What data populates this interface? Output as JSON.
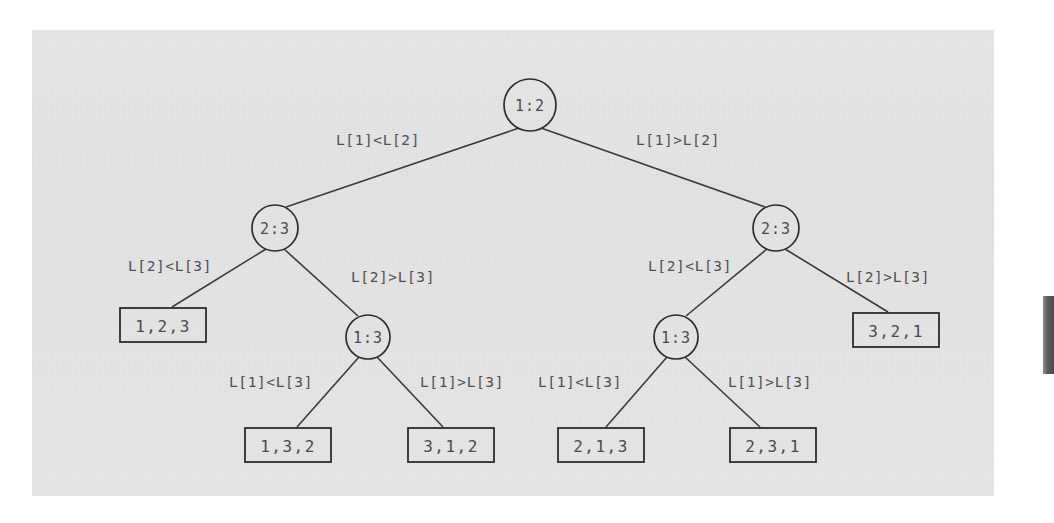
{
  "figure": {
    "type": "decision-tree",
    "background_color": "#e3e3e3",
    "ink_color": "#3a3a3a"
  },
  "nodes": [
    {
      "id": "root",
      "label": "1:2",
      "cx": 530,
      "cy": 105,
      "r": 26
    },
    {
      "id": "n-l",
      "label": "2:3",
      "cx": 275,
      "cy": 228,
      "r": 23
    },
    {
      "id": "n-r",
      "label": "2:3",
      "cx": 776,
      "cy": 228,
      "r": 23
    },
    {
      "id": "n-l-13",
      "label": "1:3",
      "cx": 368,
      "cy": 337,
      "r": 22
    },
    {
      "id": "n-r-13",
      "label": "1:3",
      "cx": 676,
      "cy": 337,
      "r": 22
    }
  ],
  "leaves": [
    {
      "id": "leaf-123",
      "label": "1,2,3",
      "x": 120,
      "y": 308,
      "w": 86,
      "h": 34
    },
    {
      "id": "leaf-132",
      "label": "1,3,2",
      "x": 245,
      "y": 428,
      "w": 86,
      "h": 34
    },
    {
      "id": "leaf-312",
      "label": "3,1,2",
      "x": 408,
      "y": 428,
      "w": 86,
      "h": 34
    },
    {
      "id": "leaf-213",
      "label": "2,1,3",
      "x": 558,
      "y": 428,
      "w": 86,
      "h": 34
    },
    {
      "id": "leaf-231",
      "label": "2,3,1",
      "x": 730,
      "y": 428,
      "w": 86,
      "h": 34
    },
    {
      "id": "leaf-321",
      "label": "3,2,1",
      "x": 853,
      "y": 313,
      "w": 86,
      "h": 34
    }
  ],
  "edges": [
    {
      "id": "e-root-left",
      "from": "root",
      "to": "n-l",
      "x1": 519,
      "y1": 128,
      "x2": 286,
      "y2": 207
    },
    {
      "id": "e-root-right",
      "from": "root",
      "to": "n-r",
      "x1": 541,
      "y1": 128,
      "x2": 765,
      "y2": 207
    },
    {
      "id": "e-l-left",
      "from": "n-l",
      "to": "leaf-123",
      "x1": 266,
      "y1": 249,
      "x2": 172,
      "y2": 307
    },
    {
      "id": "e-l-right",
      "from": "n-l",
      "to": "n-l-13",
      "x1": 284,
      "y1": 249,
      "x2": 358,
      "y2": 316
    },
    {
      "id": "e-l13-left",
      "from": "n-l-13",
      "to": "leaf-132",
      "x1": 359,
      "y1": 357,
      "x2": 297,
      "y2": 427
    },
    {
      "id": "e-l13-right",
      "from": "n-l-13",
      "to": "leaf-312",
      "x1": 377,
      "y1": 357,
      "x2": 443,
      "y2": 427
    },
    {
      "id": "e-r-left",
      "from": "n-r",
      "to": "n-r-13",
      "x1": 767,
      "y1": 249,
      "x2": 686,
      "y2": 316
    },
    {
      "id": "e-r-right",
      "from": "n-r",
      "to": "leaf-321",
      "x1": 785,
      "y1": 249,
      "x2": 888,
      "y2": 312
    },
    {
      "id": "e-r13-left",
      "from": "n-r-13",
      "to": "leaf-213",
      "x1": 667,
      "y1": 357,
      "x2": 606,
      "y2": 427
    },
    {
      "id": "e-r13-right",
      "from": "n-r-13",
      "to": "leaf-231",
      "x1": 685,
      "y1": 357,
      "x2": 760,
      "y2": 427
    }
  ],
  "edge_labels": [
    {
      "id": "lbl-root-left",
      "text": "L[1]<L[2]",
      "x": 378,
      "y": 140
    },
    {
      "id": "lbl-root-right",
      "text": "L[1]>L[2]",
      "x": 678,
      "y": 140
    },
    {
      "id": "lbl-l-left",
      "text": "L[2]<L[3]",
      "x": 170,
      "y": 266
    },
    {
      "id": "lbl-l-right",
      "text": "L[2]>L[3]",
      "x": 393,
      "y": 277
    },
    {
      "id": "lbl-l13-left",
      "text": "L[1]<L[3]",
      "x": 271,
      "y": 382
    },
    {
      "id": "lbl-l13-right",
      "text": "L[1]>L[3]",
      "x": 462,
      "y": 382
    },
    {
      "id": "lbl-r-left",
      "text": "L[2]<L[3]",
      "x": 690,
      "y": 266
    },
    {
      "id": "lbl-r-right",
      "text": "L[2]>L[3]",
      "x": 888,
      "y": 277
    },
    {
      "id": "lbl-r13-left",
      "text": "L[1]<L[3]",
      "x": 580,
      "y": 382
    },
    {
      "id": "lbl-r13-right",
      "text": "L[1]>L[3]",
      "x": 770,
      "y": 382
    }
  ]
}
